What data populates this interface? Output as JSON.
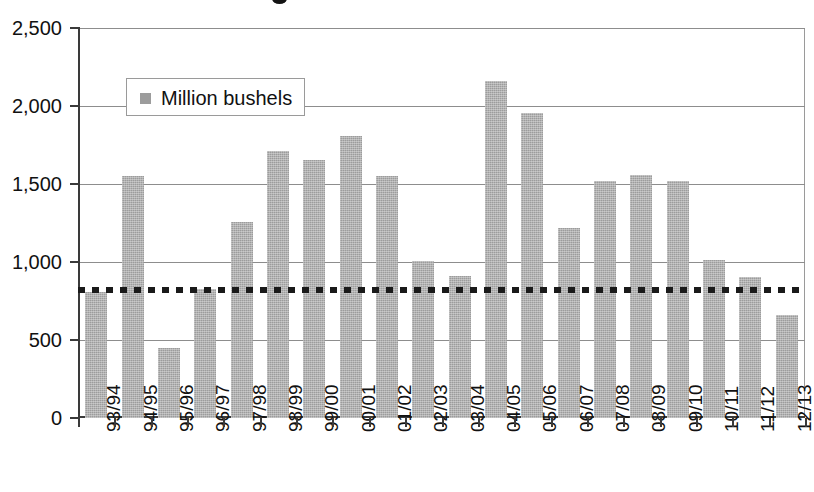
{
  "legend": {
    "label": "Million bushels",
    "swatch_color": "#9c9c9c",
    "marker": "square-marker"
  },
  "axis": {
    "y_ticks": [
      "0",
      "500",
      "1,000",
      "1,500",
      "2,000",
      "2,500"
    ],
    "x_labels": [
      "93/94",
      "94/95",
      "95/96",
      "96/97",
      "97/98",
      "98/99",
      "99/00",
      "00/01",
      "01/02",
      "02/03",
      "03/04",
      "04/05",
      "05/06",
      "06/07",
      "07/08",
      "08/09",
      "09/10",
      "10/11",
      "11/12",
      "12/13"
    ]
  },
  "chart_data": {
    "type": "bar",
    "title": "",
    "xlabel": "",
    "ylabel": "",
    "ylim": [
      0,
      2500
    ],
    "ytick_values": [
      0,
      500,
      1000,
      1500,
      2000,
      2500
    ],
    "grid": true,
    "legend_position": "top-left-inside",
    "series_name": "Million bushels",
    "bar_color": "#9c9c9c",
    "categories": [
      "93/94",
      "94/95",
      "95/96",
      "96/97",
      "97/98",
      "98/99",
      "99/00",
      "00/01",
      "01/02",
      "02/03",
      "03/04",
      "04/05",
      "05/06",
      "06/07",
      "07/08",
      "08/09",
      "09/10",
      "10/11",
      "11/12",
      "12/13"
    ],
    "values": [
      805,
      1550,
      450,
      825,
      1255,
      1710,
      1655,
      1805,
      1550,
      1005,
      910,
      2160,
      1955,
      1215,
      1520,
      1560,
      1520,
      1010,
      905,
      660
    ],
    "reference_line": {
      "value": 820,
      "style": "dotted",
      "color": "#1a1a1a",
      "label": ""
    }
  }
}
